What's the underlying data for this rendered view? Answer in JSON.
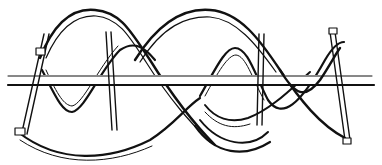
{
  "figure": {
    "colors": {
      "ink": "#111111",
      "background": "#ffffff"
    }
  }
}
